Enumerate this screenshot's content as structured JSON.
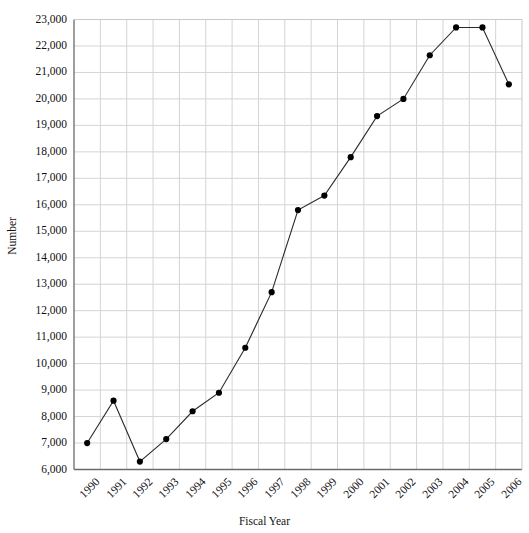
{
  "chart_data": {
    "type": "line",
    "title": "",
    "xlabel": "Fiscal Year",
    "ylabel": "Number",
    "categories": [
      "1990",
      "1991",
      "1992",
      "1993",
      "1994",
      "1995",
      "1996",
      "1997",
      "1998",
      "1999",
      "2000",
      "2001",
      "2002",
      "2003",
      "2004",
      "2005",
      "2006"
    ],
    "values": [
      7000,
      8600,
      6300,
      7150,
      8200,
      8900,
      10600,
      12700,
      15800,
      16350,
      17800,
      19350,
      20000,
      21650,
      22700,
      22700,
      20550
    ],
    "series": [
      {
        "name": "Number",
        "values": [
          7000,
          8600,
          6300,
          7150,
          8200,
          8900,
          10600,
          12700,
          15800,
          16350,
          17800,
          19350,
          20000,
          21650,
          22700,
          22700,
          20550
        ]
      }
    ],
    "ylim": [
      6000,
      23000
    ],
    "ytick_step": 1000,
    "ytick_labels": [
      "6,000",
      "7,000",
      "8,000",
      "9,000",
      "10,000",
      "11,000",
      "12,000",
      "13,000",
      "14,000",
      "15,000",
      "16,000",
      "17,000",
      "18,000",
      "19,000",
      "20,000",
      "21,000",
      "22,000",
      "23,000"
    ],
    "ytick_values": [
      6000,
      7000,
      8000,
      9000,
      10000,
      11000,
      12000,
      13000,
      14000,
      15000,
      16000,
      17000,
      18000,
      19000,
      20000,
      21000,
      22000,
      23000
    ],
    "grid": true,
    "grid_color": "#d4d4d4",
    "axis_color": "#6b6b6b",
    "line_color": "#2b2b2b",
    "marker_color": "#000000",
    "marker_shape": "circle",
    "legend": null,
    "legend_position": "none",
    "xtick_rotation": -45
  },
  "axis_titles": {
    "x": "Fiscal Year",
    "y": "Number"
  }
}
